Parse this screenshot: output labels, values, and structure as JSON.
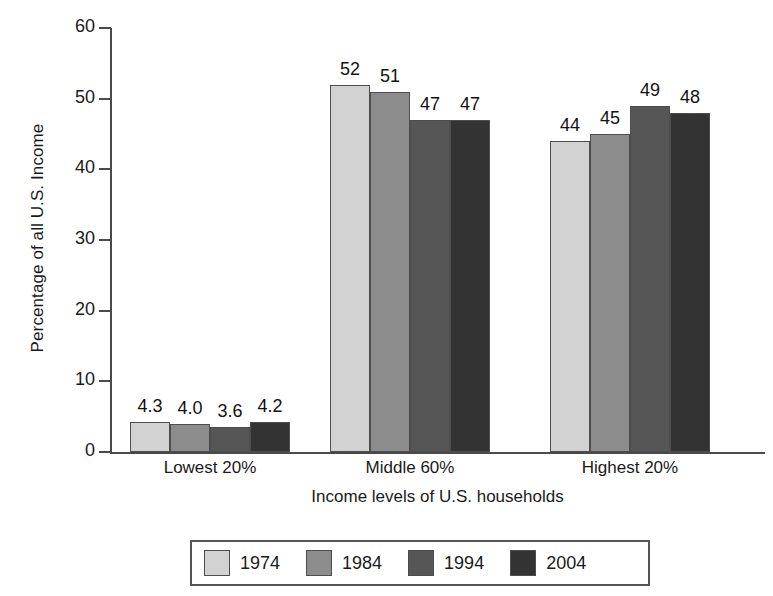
{
  "chart_data": {
    "type": "bar",
    "title": "",
    "subtitle": "",
    "xlabel": "Income levels of U.S. households",
    "ylabel": "Percentage of all U.S. Income",
    "categories": [
      "Lowest 20%",
      "Middle 60%",
      "Highest 20%"
    ],
    "series": [
      {
        "name": "1974",
        "color": "#d2d2d2",
        "values": [
          4.3,
          52,
          44
        ],
        "labels": [
          "4.3",
          "52",
          "44"
        ]
      },
      {
        "name": "1984",
        "color": "#8c8c8c",
        "values": [
          4.0,
          51,
          45
        ],
        "labels": [
          "4.0",
          "51",
          "45"
        ]
      },
      {
        "name": "1994",
        "color": "#565656",
        "values": [
          3.6,
          47,
          49
        ],
        "labels": [
          "3.6",
          "47",
          "49"
        ]
      },
      {
        "name": "2004",
        "color": "#333333",
        "values": [
          4.2,
          47,
          48
        ],
        "labels": [
          "4.2",
          "47",
          "48"
        ]
      }
    ],
    "ylim": [
      0,
      60
    ],
    "yticks": [
      0,
      10,
      20,
      30,
      40,
      50,
      60
    ],
    "ytick_labels": [
      "0",
      "10",
      "20",
      "30",
      "40",
      "50",
      "60"
    ],
    "grid": false,
    "legend_position": "bottom",
    "bar_labels_shown": true
  },
  "axis": {
    "y_title": "Percentage of all U.S. Income",
    "x_title": "Income levels of U.S. households",
    "ticks": [
      {
        "value": "60"
      },
      {
        "value": "50"
      },
      {
        "value": "40"
      },
      {
        "value": "30"
      },
      {
        "value": "20"
      },
      {
        "value": "10"
      },
      {
        "value": "0"
      }
    ]
  },
  "groups": [
    {
      "label": "Lowest 20%",
      "bars": [
        {
          "series": "1974",
          "label": "4.3",
          "value": 4.3
        },
        {
          "series": "1984",
          "label": "4.0",
          "value": 4.0
        },
        {
          "series": "1994",
          "label": "3.6",
          "value": 3.6
        },
        {
          "series": "2004",
          "label": "4.2",
          "value": 4.2
        }
      ]
    },
    {
      "label": "Middle 60%",
      "bars": [
        {
          "series": "1974",
          "label": "52",
          "value": 52
        },
        {
          "series": "1984",
          "label": "51",
          "value": 51
        },
        {
          "series": "1994",
          "label": "47",
          "value": 47
        },
        {
          "series": "2004",
          "label": "47",
          "value": 47
        }
      ]
    },
    {
      "label": "Highest 20%",
      "bars": [
        {
          "series": "1974",
          "label": "44",
          "value": 44
        },
        {
          "series": "1984",
          "label": "45",
          "value": 45
        },
        {
          "series": "1994",
          "label": "49",
          "value": 49
        },
        {
          "series": "2004",
          "label": "48",
          "value": 48
        }
      ]
    }
  ],
  "legend": {
    "entries": [
      {
        "label": "1974",
        "color": "#d2d2d2"
      },
      {
        "label": "1984",
        "color": "#8c8c8c"
      },
      {
        "label": "1994",
        "color": "#565656"
      },
      {
        "label": "2004",
        "color": "#333333"
      }
    ]
  }
}
